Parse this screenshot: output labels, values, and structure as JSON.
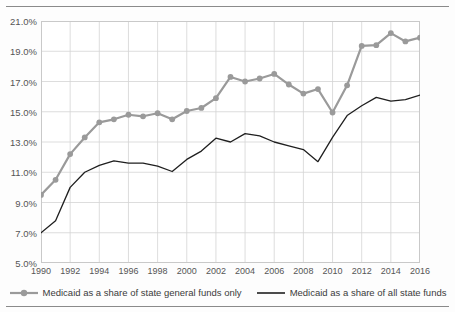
{
  "chart_data": {
    "type": "line",
    "title": "",
    "subtitle": "",
    "xlabel": "",
    "ylabel": "",
    "xlim": [
      1990,
      2016
    ],
    "ylim": [
      5.0,
      21.0
    ],
    "y_tick_step": 2.0,
    "y_tick_labels": [
      "21.0%",
      "19.0%",
      "17.0%",
      "15.0%",
      "13.0%",
      "11.0%",
      "9.0%",
      "7.0%",
      "5.0%"
    ],
    "y_tick_values": [
      21.0,
      19.0,
      17.0,
      15.0,
      13.0,
      11.0,
      9.0,
      7.0,
      5.0
    ],
    "x_tick_labels": [
      "1990",
      "1992",
      "1994",
      "1996",
      "1998",
      "2000",
      "2002",
      "2004",
      "2006",
      "2008",
      "2010",
      "2012",
      "2014",
      "2016"
    ],
    "x_tick_values": [
      1990,
      1992,
      1994,
      1996,
      1998,
      2000,
      2002,
      2004,
      2006,
      2008,
      2010,
      2012,
      2014,
      2016
    ],
    "x": [
      1990,
      1991,
      1992,
      1993,
      1994,
      1995,
      1996,
      1997,
      1998,
      1999,
      2000,
      2001,
      2002,
      2003,
      2004,
      2005,
      2006,
      2007,
      2008,
      2009,
      2010,
      2011,
      2012,
      2013,
      2014,
      2015,
      2016
    ],
    "grid": {
      "vertical": true,
      "horizontal": true,
      "color": "#d4d4d4"
    },
    "legend_position": "bottom-center",
    "value_unit": "percent",
    "series": [
      {
        "name": "Medicaid as a share of state general funds only",
        "color": "#9a9a9a",
        "marker": "circle",
        "marker_size": 5,
        "line_width": 2.2,
        "values": [
          9.5,
          10.5,
          12.2,
          13.3,
          14.3,
          14.5,
          14.8,
          14.7,
          14.9,
          14.5,
          15.05,
          15.25,
          15.9,
          17.3,
          17.0,
          17.2,
          17.5,
          16.8,
          16.2,
          16.5,
          14.95,
          16.75,
          19.35,
          19.4,
          20.2,
          19.65,
          19.9
        ]
      },
      {
        "name": "Medicaid as a share of all state funds",
        "color": "#1f1f1f",
        "marker": "none",
        "marker_size": 0,
        "line_width": 1.3,
        "values": [
          7.0,
          7.8,
          10.0,
          11.0,
          11.45,
          11.75,
          11.6,
          11.6,
          11.4,
          11.05,
          11.85,
          12.4,
          13.25,
          13.0,
          13.55,
          13.4,
          13.0,
          12.75,
          12.5,
          11.7,
          13.3,
          14.75,
          15.4,
          15.95,
          15.7,
          15.8,
          16.1
        ]
      }
    ]
  },
  "legend": {
    "items": [
      {
        "label": "Medicaid as a share of state general funds only",
        "color": "#9a9a9a",
        "style": "line-marker"
      },
      {
        "label": "Medicaid as a share of all state funds",
        "color": "#1f1f1f",
        "style": "line"
      }
    ]
  }
}
